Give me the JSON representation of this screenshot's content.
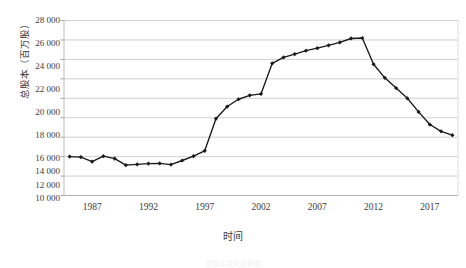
{
  "chart_data": {
    "type": "line",
    "title": "",
    "xlabel": "时间",
    "ylabel": "总股本（百万股）",
    "ylim": [
      10000,
      28000
    ],
    "ytick_labels": [
      "28 000",
      "26 000",
      "24 000",
      "22 000",
      "20 000",
      "18 000",
      "16 000",
      "14 000",
      "12 000",
      "10 000"
    ],
    "ytick_values": [
      28000,
      26000,
      24000,
      22000,
      20000,
      18000,
      16000,
      14000,
      12000,
      10000
    ],
    "xlim": [
      1984.5,
      2019.5
    ],
    "xtick_labels": [
      "1987",
      "1992",
      "1997",
      "2002",
      "2007",
      "2012",
      "2017"
    ],
    "xtick_values": [
      1987,
      1992,
      1997,
      2002,
      2007,
      2012,
      2017
    ],
    "grid": "horizontal",
    "legend": "none",
    "marker": "diamond",
    "line_color": "#1a1a1a",
    "grid_color": "#c9c9c9",
    "x": [
      1985,
      1986,
      1987,
      1988,
      1989,
      1990,
      1991,
      1992,
      1993,
      1994,
      1995,
      1996,
      1997,
      1998,
      1999,
      2000,
      2001,
      2002,
      2003,
      2004,
      2005,
      2006,
      2007,
      2008,
      2009,
      2010,
      2011,
      2012,
      2013,
      2014,
      2015,
      2016,
      2017,
      2018,
      2019
    ],
    "values": [
      14000,
      13950,
      13480,
      14050,
      13800,
      13120,
      13200,
      13280,
      13300,
      13180,
      13600,
      14050,
      14600,
      17900,
      19150,
      19900,
      20300,
      20450,
      23600,
      24200,
      24550,
      24900,
      25150,
      25450,
      25750,
      26150,
      26200,
      23500,
      22100,
      21050,
      20000,
      18600,
      17300,
      16600,
      16200
    ],
    "caption": "总股本变化趋势图"
  }
}
